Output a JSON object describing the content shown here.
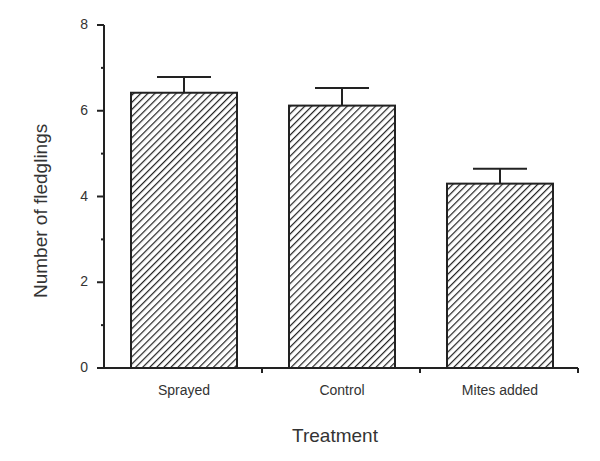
{
  "chart_data": {
    "type": "bar",
    "title": "",
    "xlabel": "Treatment",
    "ylabel": "Number of fledglings",
    "categories": [
      "Sprayed",
      "Control",
      "Mites added"
    ],
    "values": [
      6.42,
      6.12,
      4.3
    ],
    "error_upper": [
      6.79,
      6.53,
      4.65
    ],
    "ylim": [
      0,
      8
    ],
    "yticks": [
      0,
      2,
      4,
      6,
      8
    ],
    "minor_yticks": [
      1,
      3,
      5,
      7
    ],
    "grid": false,
    "bar_fill": "diagonal-hatch",
    "colors": {
      "ink": "#222222",
      "text": "#333333"
    }
  },
  "labels": {
    "xlabel": "Treatment",
    "ylabel": "Number of fledglings",
    "categories": [
      "Sprayed",
      "Control",
      "Mites added"
    ],
    "yticks": [
      "0",
      "2",
      "4",
      "6",
      "8"
    ]
  }
}
